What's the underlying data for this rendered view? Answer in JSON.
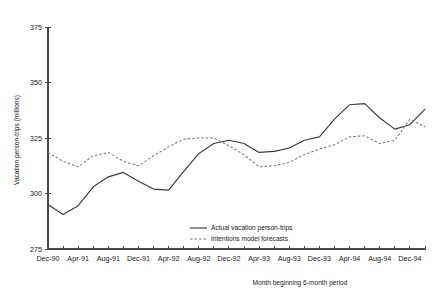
{
  "chart_data": {
    "type": "line",
    "title": "",
    "xlabel": "Month beginning 6-month period",
    "ylabel": "Vacation person-trips  (millions)",
    "ylim": [
      275,
      375
    ],
    "yticks": [
      275,
      300,
      325,
      350,
      375
    ],
    "ytick_labels": [
      "275",
      "300",
      "325",
      "350",
      "375"
    ],
    "grid": false,
    "legend_position": "bottom-center",
    "x": [
      "Dec-90",
      "Feb-91",
      "Apr-91",
      "Jun-91",
      "Aug-91",
      "Oct-91",
      "Dec-91",
      "Feb-92",
      "Apr-92",
      "Jun-92",
      "Aug-92",
      "Oct-92",
      "Dec-92",
      "Feb-93",
      "Apr-93",
      "Jun-93",
      "Aug-93",
      "Oct-93",
      "Dec-93",
      "Feb-94",
      "Apr-94",
      "Jun-94",
      "Aug-94",
      "Oct-94",
      "Dec-94",
      "Feb-95"
    ],
    "xtick_labels": [
      "Dec-90",
      "",
      "Apr-91",
      "",
      "Aug-91",
      "",
      "Dec-91",
      "",
      "Apr-92",
      "",
      "Aug-92",
      "",
      "Dec-92",
      "",
      "Apr-93",
      "",
      "Aug-93",
      "",
      "Dec-93",
      "",
      "Apr-94",
      "",
      "Aug-94",
      "",
      "Dec-94",
      ""
    ],
    "xtick_labels_shown": [
      "Dec-90",
      "Apr-91",
      "Aug-91",
      "Dec-91",
      "Apr-92",
      "Aug-92",
      "Dec-92",
      "Apr-93",
      "Aug-93",
      "Dec-93",
      "Apr-94",
      "Aug-94",
      "Dec-94"
    ],
    "series": [
      {
        "name": "Actual vacation person-trips",
        "style": "solid",
        "color": "#3b3b3b",
        "values": [
          295.0,
          290.5,
          294.5,
          303.0,
          307.5,
          309.5,
          305.5,
          302.0,
          301.5,
          310.0,
          318.0,
          322.5,
          324.0,
          322.5,
          318.5,
          319.0,
          320.5,
          324.0,
          325.5,
          333.5,
          340.0,
          340.5,
          334.0,
          329.0,
          331.0,
          338.0
        ]
      },
      {
        "name": "Intentions model forecasts",
        "style": "dashed",
        "color": "#7a7a7a",
        "values": [
          318.5,
          314.5,
          312.0,
          317.0,
          318.5,
          314.5,
          312.5,
          317.0,
          321.0,
          324.5,
          325.0,
          325.0,
          321.5,
          317.5,
          312.0,
          312.5,
          314.0,
          317.5,
          320.0,
          322.0,
          325.5,
          326.0,
          322.5,
          324.0,
          333.5,
          330.0
        ]
      }
    ],
    "legend": [
      {
        "label": "Actual vacation person-trips",
        "style": "solid"
      },
      {
        "label": "Intentions model forecasts",
        "style": "dashed"
      }
    ],
    "axis_color": "#4a4a4a"
  }
}
